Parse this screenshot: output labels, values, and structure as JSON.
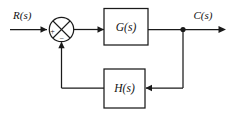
{
  "diagram": {
    "type": "control-system-block-diagram",
    "background_color": "#ffffff",
    "line_color": "#1a1a1a",
    "signals": {
      "input_label": "R(s)",
      "output_label": "C(s)"
    },
    "summing_junction": {
      "name": "summing-junction",
      "style": "circle-with-cross",
      "plus_sign": "+",
      "minus_sign": "−",
      "plus_input": "R(s)",
      "minus_input": "H(s) feedback"
    },
    "blocks": [
      {
        "id": "forward-block",
        "label": "G(s)",
        "role": "forward-path-transfer-function"
      },
      {
        "id": "feedback-block",
        "label": "H(s)",
        "role": "feedback-path-transfer-function"
      }
    ],
    "nodes": [
      {
        "id": "takeoff-node",
        "label": "",
        "role": "output-takeoff-point"
      }
    ],
    "connections": [
      {
        "from": "R(s)",
        "to": "summing-junction"
      },
      {
        "from": "summing-junction",
        "to": "G(s)"
      },
      {
        "from": "G(s)",
        "to": "takeoff-node"
      },
      {
        "from": "takeoff-node",
        "to": "C(s)"
      },
      {
        "from": "takeoff-node",
        "to": "H(s)"
      },
      {
        "from": "H(s)",
        "to": "summing-junction"
      }
    ]
  }
}
